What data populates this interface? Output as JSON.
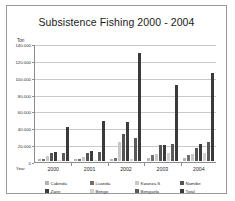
{
  "chart_data": {
    "type": "bar",
    "title": "Subsistence Fishing 2000 - 2004",
    "xlabel": "Year",
    "ylabel": "Ton",
    "categories": [
      "2000",
      "2001",
      "2002",
      "2003",
      "2004"
    ],
    "ylim": [
      0,
      140000
    ],
    "ytick_labels": [
      "0",
      "20.000",
      "40.000",
      "60.000",
      "80.000",
      "100.000",
      "120.000",
      "140.000"
    ],
    "ytick_values": [
      0,
      20000,
      40000,
      60000,
      80000,
      100000,
      120000,
      140000
    ],
    "grid": true,
    "legend_position": "bottom",
    "series": [
      {
        "name": "Cabinda",
        "color": "#b4b4b4",
        "values": [
          1800,
          2000,
          2600,
          3000,
          3400
        ]
      },
      {
        "name": "Luanda",
        "color": "#6e6e6e",
        "values": [
          2200,
          2500,
          3400,
          7000,
          7600
        ]
      },
      {
        "name": "Kwanza S",
        "color": "#c8c8c8",
        "values": [
          6500,
          5200,
          22000,
          8000,
          8200
        ]
      },
      {
        "name": "Namibe",
        "color": "#545454",
        "values": [
          9000,
          9500,
          32000,
          19000,
          16000
        ]
      },
      {
        "name": "Zaire",
        "color": "#3c3c3c",
        "values": [
          10500,
          11500,
          46000,
          19500,
          20500
        ]
      },
      {
        "name": "Bengo",
        "color": "#d2d2d2",
        "values": [
          1600,
          1700,
          2100,
          9500,
          9000
        ]
      },
      {
        "name": "Benguela",
        "color": "#5a5a5a",
        "values": [
          9500,
          11000,
          27000,
          20000,
          23000
        ]
      },
      {
        "name": "Total",
        "color": "#3a3a3a",
        "values": [
          40000,
          48000,
          128000,
          90000,
          105000
        ]
      }
    ]
  }
}
